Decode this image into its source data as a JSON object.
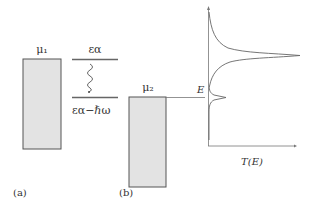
{
  "panel_a": {
    "label": "(a)",
    "reservoir_label": "μ₁",
    "upper_level_label": "εα",
    "lower_level_label": "εα−ℏω"
  },
  "panel_b": {
    "label": "(b)",
    "reservoir_label": "μ₂",
    "energy_axis_label": "E",
    "transmission_axis_label": "T(E)"
  },
  "colors": {
    "reservoir_fill": "#e3e3e3",
    "stroke": "#555555",
    "level_line": "#666666"
  }
}
